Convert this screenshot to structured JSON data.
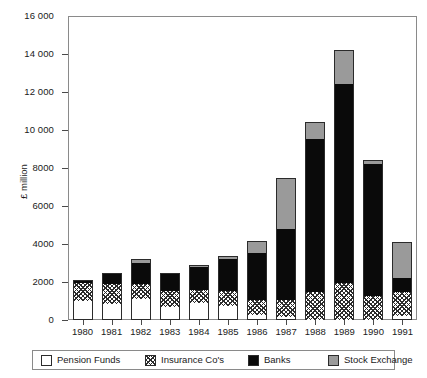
{
  "chart_data": {
    "type": "bar",
    "subtype": "stacked-vertical",
    "title": "",
    "xlabel": "",
    "ylabel": "£ million",
    "ylim": [
      0,
      16000
    ],
    "ytick_step": 2000,
    "ytick_labels": [
      "16 000",
      "14 000",
      "12 000",
      "10 000",
      "8000",
      "6000",
      "4000",
      "2000",
      "0"
    ],
    "ytick_values": [
      16000,
      14000,
      12000,
      10000,
      8000,
      6000,
      4000,
      2000,
      0
    ],
    "grid": false,
    "legend_position": "bottom",
    "categories": [
      "1980",
      "1981",
      "1982",
      "1983",
      "1984",
      "1985",
      "1986",
      "1987",
      "1988",
      "1989",
      "1990",
      "1991"
    ],
    "series": [
      {
        "name": "Pension Funds",
        "pattern": "solid-white",
        "color": "#ffffff",
        "values": [
          1000,
          850,
          1100,
          700,
          900,
          750,
          250,
          150,
          0,
          0,
          0,
          200
        ]
      },
      {
        "name": "Insurance Co's",
        "pattern": "cross-hatch",
        "color": "#2b2b2b",
        "values": [
          950,
          1050,
          800,
          850,
          700,
          800,
          800,
          900,
          1450,
          1950,
          1250,
          1300
        ]
      },
      {
        "name": "Banks",
        "pattern": "solid-black",
        "color": "#0a0a0a",
        "values": [
          100,
          600,
          1100,
          900,
          1200,
          1650,
          2500,
          3750,
          8100,
          10450,
          6950,
          700
        ]
      },
      {
        "name": "Stock Exchange",
        "pattern": "solid-grey",
        "color": "#9a9a9a",
        "values": [
          50,
          0,
          200,
          0,
          100,
          150,
          600,
          2700,
          850,
          1800,
          200,
          1900
        ]
      }
    ],
    "totals": [
      2100,
      2500,
      3200,
      2450,
      2900,
      3350,
      4150,
      7500,
      10400,
      14200,
      8400,
      4100
    ]
  },
  "legend": {
    "items": [
      {
        "label": "Pension Funds"
      },
      {
        "label": "Insurance Co's"
      },
      {
        "label": "Banks"
      },
      {
        "label": "Stock Exchange"
      }
    ]
  }
}
